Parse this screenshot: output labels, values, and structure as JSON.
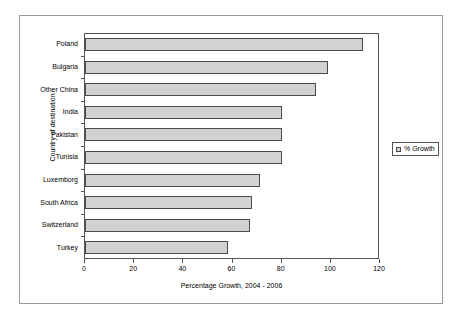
{
  "chart_data": {
    "type": "bar",
    "orientation": "horizontal",
    "title": "",
    "xlabel": "Percentage Growth, 2004 - 2006",
    "ylabel": "Country of destination",
    "xlim": [
      0,
      120
    ],
    "xticks": [
      "0",
      "20",
      "40",
      "60",
      "80",
      "100",
      "120"
    ],
    "grid": false,
    "legend": {
      "position": "right",
      "entries": [
        {
          "label": "% Growth",
          "color": "#d2d2d2",
          "swatch_icon": "legend-swatch-icon"
        }
      ]
    },
    "categories": [
      "Poland",
      "Bulgaria",
      "Other China",
      "India",
      "Pakistan",
      "Tunisia",
      "Luxemborg",
      "South Africa",
      "Switzerland",
      "Turkey"
    ],
    "series": [
      {
        "name": "% Growth",
        "values": [
          113,
          99,
          94,
          80,
          80,
          80,
          71,
          68,
          67,
          58
        ]
      }
    ]
  },
  "colors": {
    "bar_fill": "#d2d2d2",
    "bar_border": "#4a4a4a",
    "axis": "#555555",
    "frame": "#9a9a9a",
    "text": "#000000",
    "background": "#ffffff"
  }
}
